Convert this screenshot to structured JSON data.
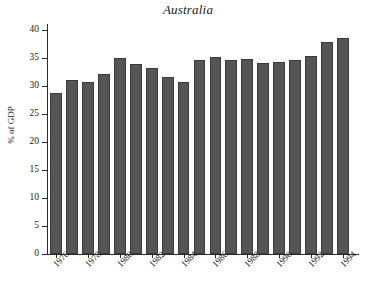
{
  "chart": {
    "title": "Australia",
    "ylabel": "% of GDP"
  },
  "chart_data": {
    "type": "bar",
    "title": "Australia",
    "xlabel": "",
    "ylabel": "% of GDP",
    "ylim": [
      0,
      41
    ],
    "grid": false,
    "legend": null,
    "yticks": [
      0,
      5,
      10,
      15,
      20,
      25,
      30,
      35,
      40
    ],
    "ytick_labels": [
      "0",
      "5",
      "10",
      "15",
      "20",
      "25",
      "30",
      "35",
      "40"
    ],
    "xtick_labels": [
      "1976",
      "1978",
      "1980",
      "1982",
      "1984",
      "1986",
      "1988",
      "1990",
      "1992",
      "1994"
    ],
    "categories": [
      "1976",
      "1977",
      "1978",
      "1979",
      "1980",
      "1981",
      "1982",
      "1983",
      "1984",
      "1985",
      "1986",
      "1987",
      "1988",
      "1989",
      "1990",
      "1991",
      "1992",
      "1993",
      "1994"
    ],
    "values": [
      28.7,
      31.1,
      30.7,
      32.1,
      34.9,
      33.8,
      33.1,
      31.5,
      30.7,
      34.6,
      35.2,
      34.6,
      34.8,
      34.0,
      34.3,
      34.6,
      35.3,
      37.8,
      38.5
    ],
    "bar_color": "#555555",
    "bar_edge_color": "#3a3a3a",
    "background_color": "#ffffff"
  }
}
